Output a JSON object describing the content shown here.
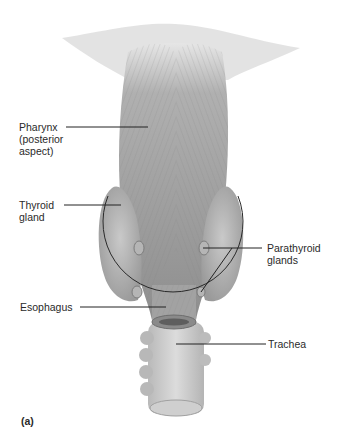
{
  "figure": {
    "panel_label": "(a)",
    "labels": {
      "pharynx": "Pharynx\n(posterior\naspect)",
      "thyroid": "Thyroid\ngland",
      "parathyroid": "Parathyroid\nglands",
      "esophagus": "Esophagus",
      "trachea": "Trachea"
    },
    "colors": {
      "tissue_dark": "#8c8c8c",
      "tissue_mid": "#a8a8a8",
      "tissue_light": "#c8c8c8",
      "leader_line": "#222222",
      "label_text": "#2a2a2a"
    }
  }
}
